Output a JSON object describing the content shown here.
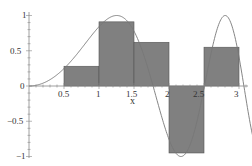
{
  "chart_data": {
    "type": "bar",
    "title": "",
    "xlabel": "x",
    "ylabel": "",
    "xlim": [
      0,
      3.2
    ],
    "ylim": [
      -1,
      1
    ],
    "grid": false,
    "legend": "none",
    "x_ticks": [
      "0.5",
      "1",
      "1.5",
      "2",
      "2.5",
      "3"
    ],
    "y_ticks": [
      "-1",
      "-0.5",
      "0",
      "0.5",
      "1"
    ],
    "bars": [
      {
        "x_left": 0.5,
        "x_right": 1.0,
        "height": 0.28
      },
      {
        "x_left": 1.0,
        "x_right": 1.5,
        "height": 0.91
      },
      {
        "x_left": 1.5,
        "x_right": 2.0,
        "height": 0.62
      },
      {
        "x_left": 2.0,
        "x_right": 2.5,
        "height": -0.95
      },
      {
        "x_left": 2.5,
        "x_right": 3.0,
        "height": 0.55
      }
    ],
    "curve": {
      "name": "sin(x^2)",
      "x_range": [
        0,
        3.2
      ]
    },
    "colors": {
      "bar_fill": "#808080",
      "bar_edge": "#555555",
      "curve": "#777777",
      "axis": "#888888"
    }
  },
  "labels": {
    "x_axis_title": "x",
    "x0_5": "0.5",
    "x1": "1",
    "x1_5": "1.5",
    "x2": "2",
    "x2_5": "2.5",
    "x3": "3",
    "y1": "1",
    "y0_5": "0.5",
    "y0": "0",
    "ym0_5": "−0.5",
    "ym1": "−1"
  }
}
